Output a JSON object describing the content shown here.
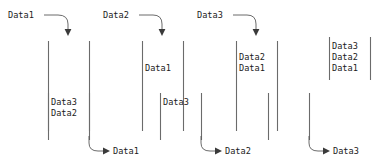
{
  "diagram": {
    "colors": {
      "wall": "#6b6b6b",
      "arrow": "#5a5a5a",
      "text": "#1a1a1a",
      "background": "#ffffff"
    },
    "top_row": {
      "operations": [
        {
          "label": "Data1",
          "arrow": "push"
        },
        {
          "label": "Data2",
          "arrow": "push"
        },
        {
          "label": "Data3",
          "arrow": "push"
        }
      ],
      "stacks": [
        {
          "items": []
        },
        {
          "items": [
            "Data1"
          ]
        },
        {
          "items": [
            "Data2",
            "Data1"
          ]
        },
        {
          "items": [
            "Data3",
            "Data2",
            "Data1"
          ]
        }
      ]
    },
    "bottom_row": {
      "operations": [
        {
          "label": "Data1",
          "arrow": "pop"
        },
        {
          "label": "Data2",
          "arrow": "pop"
        },
        {
          "label": "Data3",
          "arrow": "pop"
        }
      ],
      "stacks": [
        {
          "items": [
            "Data3",
            "Data2"
          ]
        },
        {
          "items": [
            "Data3"
          ]
        },
        {
          "items": []
        }
      ]
    }
  }
}
